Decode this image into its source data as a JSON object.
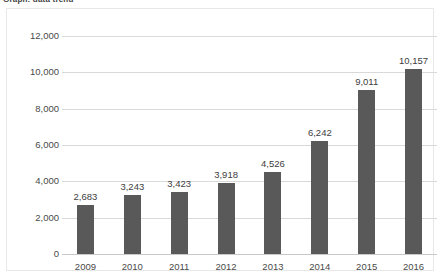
{
  "document": {
    "title_fragment": "Graph: data trend"
  },
  "chart_data": {
    "type": "bar",
    "title": "",
    "xlabel": "",
    "ylabel": "",
    "categories": [
      "2009",
      "2010",
      "2011",
      "2012",
      "2013",
      "2014",
      "2015",
      "2016"
    ],
    "values": [
      2683,
      3243,
      3423,
      3918,
      4526,
      6242,
      9011,
      10157
    ],
    "value_labels": [
      "2,683",
      "3,243",
      "3,423",
      "3,918",
      "4,526",
      "6,242",
      "9,011",
      "10,157"
    ],
    "ylim": [
      0,
      12000
    ],
    "ytick_values": [
      0,
      2000,
      4000,
      6000,
      8000,
      10000,
      12000
    ],
    "ytick_labels": [
      "0",
      "2,000",
      "4,000",
      "6,000",
      "8,000",
      "10,000",
      "12,000"
    ],
    "grid": true,
    "legend": false,
    "bar_color": "#595959",
    "gridline_color": "#d9d9d9",
    "text_color": "#4a4a4a"
  }
}
